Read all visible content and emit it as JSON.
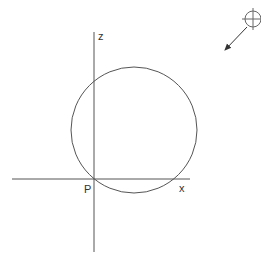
{
  "diagram": {
    "labels": {
      "z_axis": "z",
      "x_axis": "x",
      "origin": "P"
    },
    "circle": {
      "cx": 134,
      "cy": 130,
      "r": 63
    },
    "axes": {
      "vertical": {
        "x": 94,
        "y1": 32,
        "y2": 252
      },
      "horizontal": {
        "y": 179,
        "x1": 12,
        "x2": 190
      }
    },
    "north_indicator": {
      "cx": 253,
      "cy": 19,
      "r": 8
    },
    "colors": {
      "stroke": "#555555",
      "text": "#333333"
    }
  }
}
